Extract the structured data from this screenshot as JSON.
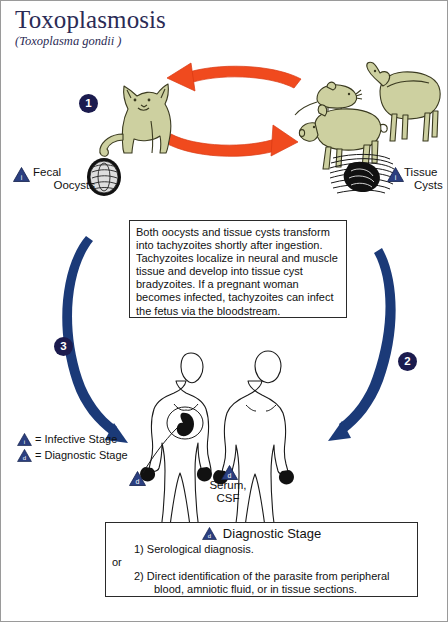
{
  "title": "Toxoplasmosis",
  "subtitle": "(Toxoplasma gondii )",
  "colors": {
    "title_navy": "#2b2b55",
    "arrow_orange": "#f04a1e",
    "arrow_blue": "#1b3a78",
    "marker_navy": "#2b3f80",
    "animal_fill": "#cdd0a0",
    "circle_navy": "#1b1b4e"
  },
  "stages": {
    "num_1": "1",
    "num_2": "2",
    "num_3": "3"
  },
  "labels": {
    "fecal_line1": "Fecal",
    "fecal_line2": "Oocysts",
    "tissue_line1": "Tissue",
    "tissue_line2": "Cysts",
    "serum_line1": "Serum,",
    "serum_line2": "CSF"
  },
  "markers": {
    "infective_letter": "i",
    "diagnostic_letter": "d"
  },
  "center_note": {
    "text": "Both oocysts and tissue cysts transform into tachyzoites shortly after ingestion. Tachyzoites localize in neural and muscle tissue and develop into tissue cyst bradyzoites. If a pregnant woman becomes infected, tachyzoites can infect the fetus via the bloodstream."
  },
  "legend": {
    "infective": "= Infective Stage",
    "diagnostic": "= Diagnostic Stage"
  },
  "diagnostic_box": {
    "heading": "Diagnostic Stage",
    "line_1": "1) Serological diagnosis.",
    "line_or": "or",
    "line_2": "2) Direct identification of the parasite from peripheral",
    "line_2b": "blood, amniotic fluid, or in tissue sections."
  },
  "figures": {
    "cat": "cat-illustration",
    "mouse": "mouse-illustration",
    "sheep": "sheep-illustration",
    "pig": "pig-illustration",
    "oocyst": "oocyst-illustration",
    "tissue_cyst": "tissue-cyst-illustration",
    "pregnant_human": "pregnant-human-figure",
    "human": "human-figure"
  }
}
